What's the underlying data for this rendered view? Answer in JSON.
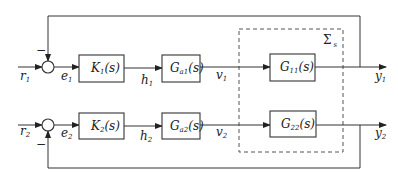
{
  "diagram": {
    "type": "block-diagram",
    "group_box": {
      "label": "Σ",
      "label_sub": "s"
    },
    "loops": [
      {
        "reference": {
          "name": "r",
          "sub": "1"
        },
        "error": {
          "name": "e",
          "sub": "1"
        },
        "feedback_sign": "−",
        "controller": {
          "name": "K",
          "sub": "1",
          "arg": "(s)"
        },
        "controller_output": {
          "name": "h",
          "sub": "1"
        },
        "actuator": {
          "name": "G",
          "sub": "a1",
          "arg": "(s)"
        },
        "actuator_output": {
          "name": "v",
          "sub": "1"
        },
        "plant": {
          "name": "G",
          "sub": "11",
          "arg": "(s)"
        },
        "output": {
          "name": "y",
          "sub": "1"
        }
      },
      {
        "reference": {
          "name": "r",
          "sub": "2"
        },
        "error": {
          "name": "e",
          "sub": "2"
        },
        "feedback_sign": "−",
        "controller": {
          "name": "K",
          "sub": "2",
          "arg": "(s)"
        },
        "controller_output": {
          "name": "h",
          "sub": "2"
        },
        "actuator": {
          "name": "G",
          "sub": "a2",
          "arg": "(s)"
        },
        "actuator_output": {
          "name": "v",
          "sub": "2"
        },
        "plant": {
          "name": "G",
          "sub": "22",
          "arg": "(s)"
        },
        "output": {
          "name": "y",
          "sub": "2"
        }
      }
    ],
    "colors": {
      "stroke": "#333333",
      "background": "#ffffff"
    }
  }
}
